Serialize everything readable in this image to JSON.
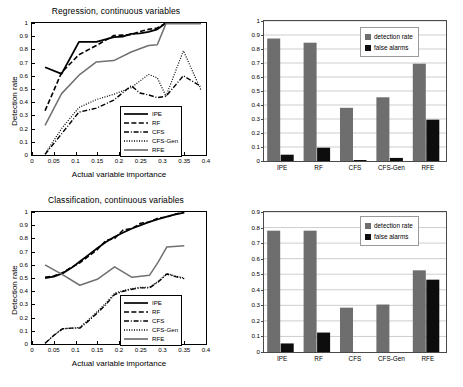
{
  "figure": {
    "background": "#ffffff",
    "colors": {
      "black": "#000000",
      "gray_line": "#707070",
      "bar_detection": "#6e6e6e",
      "bar_false": "#0d0d0d",
      "grid": "#b9b9b9",
      "axis": "#4a4a4a"
    }
  },
  "panels": {
    "top_left": {
      "name": "regression-line-plot",
      "chart_data": {
        "type": "line",
        "title": "Regression, continuous variables",
        "xlabel": "Actual variable importance",
        "ylabel": "Detection rate",
        "xlim": [
          0,
          0.4
        ],
        "ylim": [
          0,
          1
        ],
        "xticks": [
          0,
          0.05,
          0.1,
          0.15,
          0.2,
          0.25,
          0.3,
          0.35,
          0.4
        ],
        "xticklabels": [
          "0",
          "0.05",
          "0.1",
          "0.15",
          "0.2",
          "0.25",
          "0.3",
          "0.35",
          "0.4"
        ],
        "yticks": [
          0,
          0.1,
          0.2,
          0.3,
          0.4,
          0.5,
          0.6,
          0.7,
          0.8,
          0.9,
          1
        ],
        "yticklabels": [
          "0",
          "0.1",
          "0.2",
          "0.3",
          "0.4",
          "0.5",
          "0.6",
          "0.7",
          "0.8",
          "0.9",
          "1"
        ],
        "grid": false,
        "legend_position": "lower right",
        "series": [
          {
            "name": "IPE",
            "style": "solid",
            "color": "#000000",
            "width": 1.8,
            "x": [
              0.03,
              0.068,
              0.108,
              0.148,
              0.188,
              0.208,
              0.228,
              0.248,
              0.268,
              0.288,
              0.308,
              0.348,
              0.388
            ],
            "y": [
              0.665,
              0.615,
              0.857,
              0.857,
              0.893,
              0.897,
              0.917,
              0.922,
              0.932,
              0.952,
              1.0,
              1.0,
              1.0
            ]
          },
          {
            "name": "RF",
            "style": "dashed",
            "color": "#000000",
            "width": 1.6,
            "x": [
              0.03,
              0.068,
              0.108,
              0.148,
              0.188,
              0.208,
              0.228,
              0.248,
              0.268,
              0.288,
              0.308,
              0.348,
              0.388
            ],
            "y": [
              0.335,
              0.625,
              0.76,
              0.83,
              0.905,
              0.908,
              0.912,
              0.935,
              0.952,
              0.962,
              1.0,
              1.0,
              1.0
            ]
          },
          {
            "name": "CFS",
            "style": "dashdot",
            "color": "#000000",
            "width": 1.4,
            "x": [
              0.03,
              0.068,
              0.108,
              0.148,
              0.188,
              0.228,
              0.248,
              0.268,
              0.288,
              0.308,
              0.348,
              0.388
            ],
            "y": [
              0.005,
              0.16,
              0.325,
              0.355,
              0.415,
              0.525,
              0.47,
              0.455,
              0.435,
              0.445,
              0.6,
              0.52
            ]
          },
          {
            "name": "CFS-Gen",
            "style": "dotted",
            "color": "#000000",
            "width": 1.2,
            "x": [
              0.03,
              0.068,
              0.108,
              0.148,
              0.188,
              0.228,
              0.268,
              0.288,
              0.308,
              0.348,
              0.388
            ],
            "y": [
              0.01,
              0.2,
              0.36,
              0.42,
              0.46,
              0.51,
              0.61,
              0.585,
              0.445,
              0.79,
              0.495
            ]
          },
          {
            "name": "RFE",
            "style": "solid",
            "color": "#707070",
            "width": 1.5,
            "x": [
              0.03,
              0.068,
              0.108,
              0.148,
              0.188,
              0.228,
              0.268,
              0.288,
              0.308,
              0.348,
              0.388
            ],
            "y": [
              0.225,
              0.465,
              0.605,
              0.705,
              0.715,
              0.78,
              0.83,
              0.835,
              0.995,
              0.995,
              0.995
            ]
          }
        ]
      },
      "legend": [
        {
          "label": "IPE",
          "style": "solid",
          "color": "#000000"
        },
        {
          "label": "RF",
          "style": "dashed",
          "color": "#000000"
        },
        {
          "label": "CFS",
          "style": "dashdot",
          "color": "#000000"
        },
        {
          "label": "CFS-Gen",
          "style": "dotted",
          "color": "#000000"
        },
        {
          "label": "RFE",
          "style": "solid",
          "color": "#707070"
        }
      ]
    },
    "top_right": {
      "name": "regression-bar-chart",
      "chart_data": {
        "type": "bar",
        "title": "",
        "categories": [
          "IPE",
          "RF",
          "CFS",
          "CFS-Gen",
          "RFE"
        ],
        "xlabel": "",
        "ylabel": "",
        "ylim": [
          0,
          1
        ],
        "yticks": [
          0,
          0.1,
          0.2,
          0.3,
          0.4,
          0.5,
          0.6,
          0.7,
          0.8,
          0.9,
          1
        ],
        "yticklabels": [
          "0",
          "0.1",
          "0.2",
          "0.3",
          "0.4",
          "0.5",
          "0.6",
          "0.7",
          "0.8",
          "0.9",
          "1"
        ],
        "grid": true,
        "legend_position": "upper right",
        "series": [
          {
            "name": "detection rate",
            "color": "#6e6e6e",
            "values": [
              0.875,
              0.845,
              0.38,
              0.455,
              0.695
            ]
          },
          {
            "name": "false alarms",
            "color": "#0d0d0d",
            "values": [
              0.045,
              0.095,
              0.007,
              0.022,
              0.295
            ]
          }
        ]
      },
      "legend": [
        {
          "label": "detection rate",
          "color": "#6e6e6e"
        },
        {
          "label": "false alarms",
          "color": "#0d0d0d"
        }
      ]
    },
    "bottom_left": {
      "name": "classification-line-plot",
      "chart_data": {
        "type": "line",
        "title": "Classification, continuous variables",
        "xlabel": "Actual variable importance",
        "ylabel": "Detection rate",
        "xlim": [
          0,
          0.4
        ],
        "ylim": [
          0,
          1
        ],
        "xticks": [
          0,
          0.05,
          0.1,
          0.15,
          0.2,
          0.25,
          0.3,
          0.35,
          0.4
        ],
        "xticklabels": [
          "0",
          "0.05",
          "0.1",
          "0.15",
          "0.2",
          "0.25",
          "0.3",
          "0.35",
          "0.4"
        ],
        "yticks": [
          0,
          0.1,
          0.2,
          0.3,
          0.4,
          0.5,
          0.6,
          0.7,
          0.8,
          0.9,
          1
        ],
        "yticklabels": [
          "0",
          "0.1",
          "0.2",
          "0.3",
          "0.4",
          "0.5",
          "0.6",
          "0.7",
          "0.8",
          "0.9",
          "1"
        ],
        "grid": false,
        "legend_position": "lower right",
        "series": [
          {
            "name": "IPE",
            "style": "solid",
            "color": "#000000",
            "width": 1.8,
            "x": [
              0.03,
              0.05,
              0.07,
              0.09,
              0.11,
              0.13,
              0.15,
              0.17,
              0.19,
              0.21,
              0.23,
              0.25,
              0.27,
              0.29,
              0.31,
              0.33,
              0.35
            ],
            "y": [
              0.5,
              0.51,
              0.535,
              0.575,
              0.625,
              0.675,
              0.725,
              0.772,
              0.812,
              0.845,
              0.875,
              0.9,
              0.925,
              0.945,
              0.965,
              0.982,
              0.995
            ]
          },
          {
            "name": "RF",
            "style": "dashed",
            "color": "#000000",
            "width": 1.5,
            "x": [
              0.03,
              0.05,
              0.07,
              0.09,
              0.11,
              0.13,
              0.15,
              0.17,
              0.19,
              0.21,
              0.23,
              0.25,
              0.27,
              0.29,
              0.31,
              0.33,
              0.35
            ],
            "y": [
              0.505,
              0.515,
              0.54,
              0.58,
              0.615,
              0.665,
              0.715,
              0.785,
              0.8,
              0.865,
              0.875,
              0.915,
              0.925,
              0.955,
              0.962,
              0.985,
              1.0
            ]
          },
          {
            "name": "CFS",
            "style": "dashdot",
            "color": "#000000",
            "width": 1.4,
            "x": [
              0.03,
              0.05,
              0.07,
              0.09,
              0.11,
              0.13,
              0.15,
              0.17,
              0.19,
              0.21,
              0.23,
              0.25,
              0.27,
              0.29,
              0.31,
              0.33,
              0.35
            ],
            "y": [
              0.005,
              0.065,
              0.115,
              0.12,
              0.12,
              0.175,
              0.235,
              0.3,
              0.375,
              0.4,
              0.415,
              0.425,
              0.425,
              0.47,
              0.53,
              0.51,
              0.495
            ]
          },
          {
            "name": "CFS-Gen",
            "style": "dotted",
            "color": "#000000",
            "width": 1.2,
            "x": [
              0.03,
              0.05,
              0.07,
              0.09,
              0.11,
              0.13,
              0.15,
              0.17,
              0.19,
              0.21,
              0.23,
              0.25,
              0.27,
              0.29,
              0.31,
              0.33,
              0.35
            ],
            "y": [
              0.005,
              0.065,
              0.115,
              0.12,
              0.125,
              0.185,
              0.245,
              0.31,
              0.385,
              0.405,
              0.42,
              0.43,
              0.43,
              0.475,
              0.535,
              0.515,
              0.5
            ]
          },
          {
            "name": "RFE",
            "style": "solid",
            "color": "#707070",
            "width": 1.5,
            "x": [
              0.03,
              0.07,
              0.11,
              0.15,
              0.19,
              0.23,
              0.27,
              0.29,
              0.31,
              0.35
            ],
            "y": [
              0.6,
              0.525,
              0.445,
              0.49,
              0.585,
              0.505,
              0.52,
              0.62,
              0.735,
              0.745
            ]
          }
        ]
      },
      "legend": [
        {
          "label": "IPE",
          "style": "solid",
          "color": "#000000"
        },
        {
          "label": "RF",
          "style": "dashed",
          "color": "#000000"
        },
        {
          "label": "CFS",
          "style": "dashdot",
          "color": "#000000"
        },
        {
          "label": "CFS-Gen",
          "style": "dotted",
          "color": "#000000"
        },
        {
          "label": "RFE",
          "style": "solid",
          "color": "#707070"
        }
      ]
    },
    "bottom_right": {
      "name": "classification-bar-chart",
      "chart_data": {
        "type": "bar",
        "title": "",
        "categories": [
          "IPE",
          "RF",
          "CFS",
          "CFS-Gen",
          "RFE"
        ],
        "xlabel": "",
        "ylabel": "",
        "ylim": [
          0,
          0.9
        ],
        "yticks": [
          0,
          0.1,
          0.2,
          0.3,
          0.4,
          0.5,
          0.6,
          0.7,
          0.8,
          0.9
        ],
        "yticklabels": [
          "0",
          "0.1",
          "0.2",
          "0.3",
          "0.4",
          "0.5",
          "0.6",
          "0.7",
          "0.8",
          "0.9"
        ],
        "grid": true,
        "legend_position": "upper right",
        "series": [
          {
            "name": "detection rate",
            "color": "#6e6e6e",
            "values": [
              0.78,
              0.78,
              0.285,
              0.305,
              0.525
            ]
          },
          {
            "name": "false alarms",
            "color": "#0d0d0d",
            "values": [
              0.055,
              0.125,
              0.0,
              0.0,
              0.465
            ]
          }
        ]
      },
      "legend": [
        {
          "label": "detection rate",
          "color": "#6e6e6e"
        },
        {
          "label": "false alarms",
          "color": "#0d0d0d"
        }
      ]
    }
  }
}
